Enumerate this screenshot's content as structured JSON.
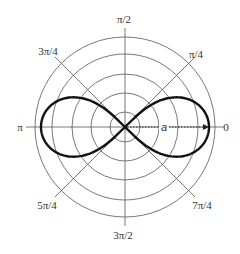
{
  "figure": {
    "center": [
      125,
      127
    ],
    "ring_radii": [
      15,
      34,
      53,
      73,
      90
    ],
    "lemniscate_a": 84,
    "colors": {
      "grid": "#555555",
      "curve": "#111111",
      "text": "#333333",
      "background": "#ffffff"
    },
    "angle_labels": [
      {
        "id": "0",
        "text": "0",
        "x": 226,
        "y": 131
      },
      {
        "id": "pi_4",
        "text": "π/4",
        "x": 196,
        "y": 58
      },
      {
        "id": "pi_2",
        "text": "π/2",
        "x": 124,
        "y": 23
      },
      {
        "id": "3pi_4",
        "text": "3π/4",
        "x": 48,
        "y": 55
      },
      {
        "id": "pi",
        "text": "π",
        "x": 20,
        "y": 131
      },
      {
        "id": "5pi_4",
        "text": "5π/4",
        "x": 47,
        "y": 209
      },
      {
        "id": "3pi_2",
        "text": "3π/2",
        "x": 123,
        "y": 239
      },
      {
        "id": "7pi_4",
        "text": "7π/4",
        "x": 202,
        "y": 209
      }
    ],
    "radius_label": {
      "text": "a",
      "x": 164,
      "y": 131
    }
  },
  "chart_data": {
    "type": "line",
    "coordinate_system": "polar",
    "title": "",
    "curve": "lemniscate of Bernoulli: r^2 = a^2 cos(2θ)",
    "parameter": "a",
    "angular_ticks": [
      "0",
      "π/4",
      "π/2",
      "3π/4",
      "π",
      "5π/4",
      "3π/2",
      "7π/4"
    ],
    "radial_rings": 5,
    "annotation": "dotted arrow from origin along θ = 0 to r = a, labeled 'a'",
    "grid": true,
    "legend": "none"
  }
}
